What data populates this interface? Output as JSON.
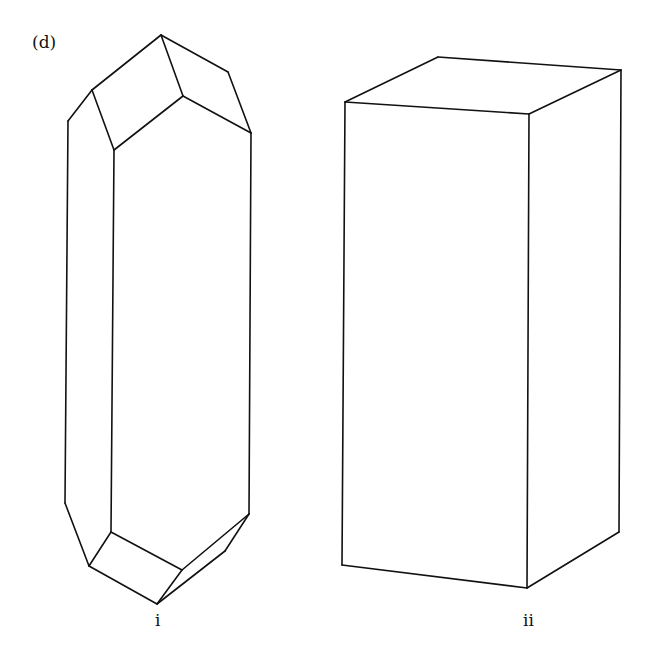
{
  "figure": {
    "panel_label": "(d)",
    "drawings": [
      {
        "id": "i",
        "label": "i",
        "description": "Elongated prismatic crystal with pyramidal terminations (hexagonal prism habit)",
        "edges": [
          [
            [
              161,
              35
            ],
            [
              92,
              90
            ]
          ],
          [
            [
              92,
              90
            ],
            [
              68,
              121
            ]
          ],
          [
            [
              161,
              35
            ],
            [
              228,
              72
            ]
          ],
          [
            [
              228,
              72
            ],
            [
              251,
              133
            ]
          ],
          [
            [
              161,
              35
            ],
            [
              183,
              96
            ]
          ],
          [
            [
              183,
              96
            ],
            [
              251,
              133
            ]
          ],
          [
            [
              92,
              90
            ],
            [
              114,
              150
            ]
          ],
          [
            [
              114,
              150
            ],
            [
              183,
              96
            ]
          ],
          [
            [
              68,
              121
            ],
            [
              65,
              503
            ]
          ],
          [
            [
              114,
              150
            ],
            [
              111,
              532
            ]
          ],
          [
            [
              251,
              133
            ],
            [
              249,
              514
            ]
          ],
          [
            [
              65,
              503
            ],
            [
              89,
              566
            ]
          ],
          [
            [
              111,
              532
            ],
            [
              89,
              566
            ]
          ],
          [
            [
              111,
              532
            ],
            [
              182,
              570
            ]
          ],
          [
            [
              89,
              566
            ],
            [
              157,
              604
            ]
          ],
          [
            [
              182,
              570
            ],
            [
              249,
              514
            ]
          ],
          [
            [
              157,
              604
            ],
            [
              182,
              570
            ]
          ],
          [
            [
              157,
              604
            ],
            [
              225,
              551
            ]
          ],
          [
            [
              225,
              551
            ],
            [
              249,
              514
            ]
          ]
        ]
      },
      {
        "id": "ii",
        "label": "ii",
        "description": "Rectangular prism (box-shaped crystal)",
        "edges": [
          [
            [
              345,
              102
            ],
            [
              438,
              57
            ]
          ],
          [
            [
              438,
              57
            ],
            [
              621,
              70
            ]
          ],
          [
            [
              621,
              70
            ],
            [
              529,
              114
            ]
          ],
          [
            [
              529,
              114
            ],
            [
              345,
              102
            ]
          ],
          [
            [
              345,
              102
            ],
            [
              342,
              565
            ]
          ],
          [
            [
              529,
              114
            ],
            [
              527,
              588
            ]
          ],
          [
            [
              621,
              70
            ],
            [
              619,
              532
            ]
          ],
          [
            [
              342,
              565
            ],
            [
              527,
              588
            ]
          ],
          [
            [
              527,
              588
            ],
            [
              619,
              532
            ]
          ]
        ]
      }
    ]
  }
}
